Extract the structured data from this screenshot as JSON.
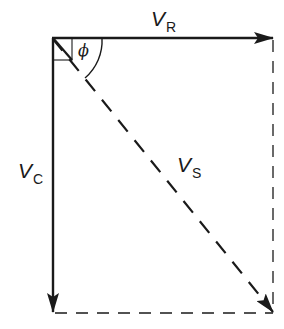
{
  "diagram": {
    "labels": {
      "vr": {
        "main": "V",
        "sub": "R"
      },
      "vc": {
        "main": "V",
        "sub": "C"
      },
      "vs": {
        "main": "V",
        "sub": "S"
      },
      "angle": "ϕ"
    },
    "colors": {
      "ink": "#1a1a1a",
      "background": "#ffffff"
    },
    "geometry": {
      "origin": [
        52,
        38
      ],
      "vr_end": [
        273,
        38
      ],
      "vc_end": [
        53,
        312
      ],
      "vs_end": [
        273,
        312
      ],
      "right_angle_box": 20,
      "angle_arc_radius": 50
    },
    "vectors": [
      {
        "name": "V_R",
        "direction": "right",
        "style": "solid"
      },
      {
        "name": "V_C",
        "direction": "down",
        "style": "solid"
      },
      {
        "name": "V_S",
        "direction": "diagonal-down-right",
        "style": "dashed"
      }
    ],
    "construction_lines": [
      {
        "name": "right-projection",
        "style": "dashed"
      },
      {
        "name": "bottom-projection",
        "style": "dashed"
      }
    ]
  }
}
